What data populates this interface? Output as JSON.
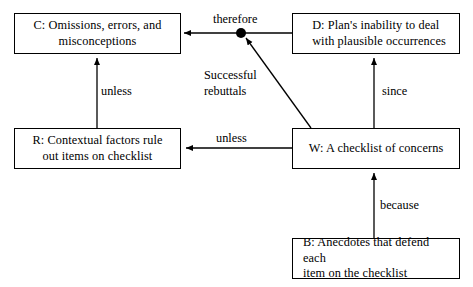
{
  "figure": {
    "background_color": "#ffffff",
    "line_color": "#000000",
    "text_color": "#000000"
  },
  "nodes": [
    {
      "id": "c",
      "name": "claim-node",
      "label": "C: Omissions, errors, and\nmisconceptions"
    },
    {
      "id": "d",
      "name": "data-node",
      "label": "D: Plan's inability to deal\n    with plausible occurrences"
    },
    {
      "id": "r",
      "name": "rebuttal-node",
      "label": "R: Contextual factors rule\nout items on checklist"
    },
    {
      "id": "w",
      "name": "warrant-node",
      "label": "W: A checklist of concerns"
    },
    {
      "id": "b",
      "name": "backing-node",
      "label": "B: Anecdotes that defend each\n  item on the checklist"
    }
  ],
  "edge_labels": {
    "therefore": "therefore",
    "unless_claim_rebuttal": "unless",
    "unless_warrant_rebuttal": "unless",
    "since": "since",
    "because": "because",
    "successful_rebuttals": "Successful\nrebuttals"
  },
  "junction": {
    "name": "therefore-junction-dot",
    "cx": 241,
    "cy": 33,
    "r": 5
  }
}
